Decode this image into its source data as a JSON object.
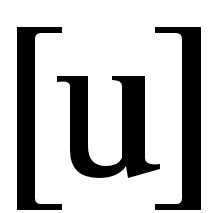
{
  "symbol": {
    "text": "[u]",
    "open_bracket": "[",
    "letter": "u",
    "close_bracket": "]"
  },
  "colors": {
    "foreground": "#000000",
    "background": "#ffffff"
  }
}
